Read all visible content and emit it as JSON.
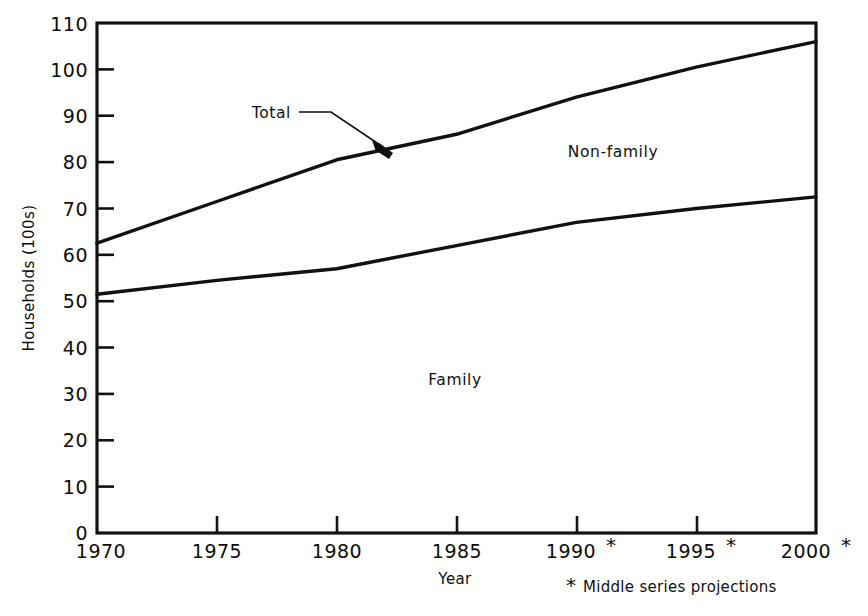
{
  "chart_data": {
    "type": "line",
    "title": "",
    "subtitle": "",
    "xlabel": "Year",
    "ylabel": "Households (100s)",
    "x": [
      1970,
      1975,
      1980,
      1985,
      1990,
      1995,
      2000
    ],
    "xtick_labels": [
      "1970",
      "1975",
      "1980",
      "1985",
      "1990*",
      "1995*",
      "2000*"
    ],
    "ytick_labels": [
      "0",
      "10",
      "20",
      "30",
      "40",
      "50",
      "60",
      "70",
      "80",
      "90",
      "100",
      "110"
    ],
    "ytick_values": [
      0,
      10,
      20,
      30,
      40,
      50,
      60,
      70,
      80,
      90,
      100,
      110
    ],
    "xlim": [
      1970,
      2000
    ],
    "ylim": [
      0,
      110
    ],
    "grid": false,
    "legend_position": "inline-annotations",
    "series": [
      {
        "name": "Total",
        "values": [
          62.5,
          71.5,
          80.5,
          86.0,
          94.0,
          100.5,
          106.0
        ]
      },
      {
        "name": "Family",
        "values": [
          51.5,
          54.5,
          57.0,
          62.0,
          67.0,
          70.0,
          72.5
        ]
      }
    ],
    "annotations": [
      {
        "text": "Total",
        "note": "arrow pointing to upper (Total) line near 1984"
      },
      {
        "text": "Non-family",
        "note": "region between Total and Family lines"
      },
      {
        "text": "Family",
        "note": "region below Family line"
      }
    ],
    "footnote": "*Middle series projections",
    "star_symbol": "*",
    "line_color": "#111111",
    "background_color": "#ffffff"
  },
  "axes": {
    "y_title": "Households (100s)",
    "x_title": "Year",
    "y_ticks": [
      "110",
      "100",
      "90",
      "80",
      "70",
      "60",
      "50",
      "40",
      "30",
      "20",
      "10",
      "0"
    ],
    "x_ticks": [
      {
        "label": "1970",
        "starred": false
      },
      {
        "label": "1975",
        "starred": false
      },
      {
        "label": "1980",
        "starred": false
      },
      {
        "label": "1985",
        "starred": false
      },
      {
        "label": "1990",
        "starred": true
      },
      {
        "label": "1995",
        "starred": true
      },
      {
        "label": "2000",
        "starred": true
      }
    ]
  },
  "labels": {
    "total": "Total",
    "non_family": "Non-family",
    "family": "Family",
    "footnote": "Middle series projections",
    "footnote_star": "*"
  }
}
